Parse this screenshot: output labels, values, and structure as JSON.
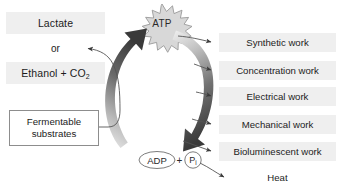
{
  "diagram": {
    "center": {
      "atp": "ATP",
      "adp": "ADP",
      "plus": "+",
      "pi": "P",
      "pi_subscript": "i"
    },
    "left": {
      "lactate": "Lactate",
      "or": "or",
      "ethanol": "Ethanol + CO",
      "ethanol_subscript": "2",
      "fermentable_line1": "Fermentable",
      "fermentable_line2": "substrates"
    },
    "outputs": [
      {
        "label": "Synthetic work",
        "banded": true
      },
      {
        "label": "Concentration work",
        "banded": true
      },
      {
        "label": "Electrical work",
        "banded": true
      },
      {
        "label": "Mechanical work",
        "banded": true
      },
      {
        "label": "Bioluminescent work",
        "banded": true
      },
      {
        "label": "Heat",
        "banded": false
      }
    ],
    "colors": {
      "band": "#efefef",
      "arrow_dark": "#3f3f3f",
      "arrow_light": "#e8e8e8",
      "line": "#555555",
      "box_border": "#8d8d8d",
      "burst_fill": "#d8d8d8",
      "burst_stroke": "#9a9a9a"
    }
  }
}
